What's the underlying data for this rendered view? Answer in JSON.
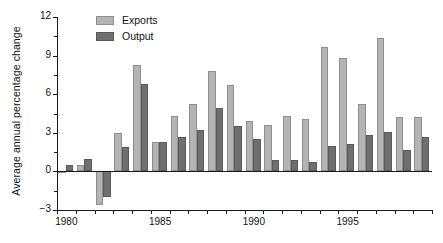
{
  "chart_data": {
    "type": "bar",
    "title": "",
    "xlabel": "",
    "ylabel": "Average annual percentage change",
    "ylim": [
      -3,
      12
    ],
    "ytick_values": [
      -3,
      0,
      3,
      6,
      9,
      12
    ],
    "ytick_labels": [
      "−3",
      "0",
      "3",
      "6",
      "9",
      "12"
    ],
    "xlim": [
      1979.5,
      1999.5
    ],
    "categories": [
      1980,
      1981,
      1982,
      1983,
      1984,
      1985,
      1986,
      1987,
      1988,
      1989,
      1990,
      1991,
      1992,
      1993,
      1994,
      1995,
      1996,
      1997,
      1998,
      1999
    ],
    "xtick_labels_shown": [
      "1980",
      "1985",
      "1990",
      "1995"
    ],
    "xtick_label_years": [
      1980,
      1985,
      1990,
      1995
    ],
    "grid": false,
    "legend_position": "top-left",
    "series": [
      {
        "name": "Exports",
        "color": "#b4b4b4",
        "values": [
          -0.1,
          0.5,
          -2.6,
          3.0,
          8.3,
          2.3,
          4.3,
          5.2,
          7.8,
          6.7,
          3.9,
          3.6,
          4.3,
          4.1,
          9.7,
          8.8,
          5.2,
          10.4,
          4.2,
          4.2
        ]
      },
      {
        "name": "Output",
        "color": "#6f6f6f",
        "values": [
          0.5,
          1.0,
          -2.0,
          1.9,
          6.8,
          2.3,
          2.7,
          3.2,
          4.9,
          3.5,
          2.5,
          0.9,
          0.9,
          0.7,
          2.0,
          2.1,
          2.8,
          3.1,
          1.7,
          2.7
        ]
      }
    ]
  },
  "legend": {
    "items": [
      {
        "label": "Exports",
        "color": "#b4b4b4"
      },
      {
        "label": "Output",
        "color": "#6f6f6f"
      }
    ]
  },
  "axis": {
    "y_title": "Average annual percentage change"
  },
  "colors": {
    "exports": "#b4b4b4",
    "output": "#6f6f6f",
    "axis": "#1a1a1a",
    "background": "#ffffff"
  }
}
